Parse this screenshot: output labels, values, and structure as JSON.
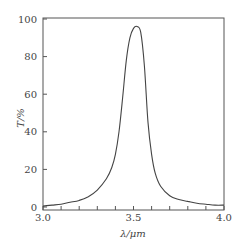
{
  "chart_data": {
    "type": "line",
    "title": "",
    "xlabel": "λ/μm",
    "ylabel": "T/%",
    "xlim": [
      3.0,
      4.0
    ],
    "ylim": [
      0,
      100
    ],
    "xticks_major": [
      3.0,
      3.5,
      4.0
    ],
    "xtick_labels": [
      "3.0",
      "3.5",
      "4.0"
    ],
    "xticks_minor_step": 0.1,
    "yticks": [
      0,
      20,
      40,
      60,
      80,
      100
    ],
    "ytick_labels": [
      "0",
      "20",
      "40",
      "60",
      "80",
      "100"
    ],
    "grid": false,
    "legend": null,
    "series": [
      {
        "name": "transmittance",
        "color": "#444444",
        "x": [
          3.0,
          3.05,
          3.1,
          3.15,
          3.2,
          3.25,
          3.3,
          3.35,
          3.38,
          3.4,
          3.42,
          3.44,
          3.46,
          3.48,
          3.5,
          3.52,
          3.54,
          3.56,
          3.58,
          3.6,
          3.62,
          3.65,
          3.7,
          3.75,
          3.8,
          3.85,
          3.9,
          3.95,
          4.0
        ],
        "values": [
          0.5,
          1,
          1.5,
          2.5,
          3.5,
          5.5,
          9,
          15,
          21,
          28,
          40,
          58,
          78,
          90,
          95,
          96,
          93,
          75,
          45,
          28,
          18,
          11,
          6,
          4,
          3,
          2,
          1.5,
          1,
          1
        ]
      }
    ]
  }
}
